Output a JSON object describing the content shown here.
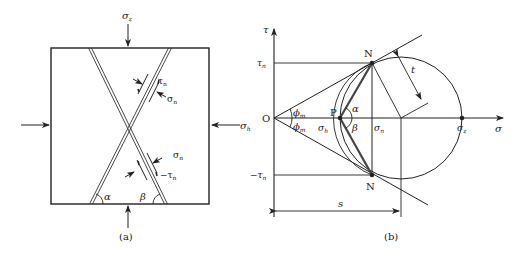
{
  "panel_a": {
    "caption": "(a)",
    "top_load": "σ",
    "top_load_sub": "z",
    "right_load": "σ",
    "right_load_sub": "h",
    "upper_shear": "τ",
    "upper_shear_sub": "n",
    "upper_normal": "σ",
    "upper_normal_sub": "n",
    "lower_normal": "σ",
    "lower_normal_sub": "n",
    "lower_shear": "−τ",
    "lower_shear_sub": "n",
    "angle_left": "α",
    "angle_right": "β"
  },
  "panel_b": {
    "caption": "(b)",
    "y_axis": "τ",
    "x_axis": "σ",
    "origin": "O",
    "tau_n": "τ",
    "tau_n_sub": "n",
    "neg_tau_n": "−τ",
    "neg_tau_n_sub": "n",
    "point_top": "N",
    "point_bottom": "N",
    "point_p": "P",
    "phi_top": "ϕ",
    "phi_top_sub": "m",
    "phi_bottom": "ϕ",
    "phi_bottom_sub": "m",
    "sigma_h": "σ",
    "sigma_h_sub": "h",
    "sigma_n": "σ",
    "sigma_n_sub": "n",
    "sigma_z": "σ",
    "sigma_z_sub": "z",
    "alpha": "α",
    "beta": "β",
    "radius_label": "t",
    "distance_label": "s"
  },
  "colors": {
    "line": "#222222",
    "thick_line": "#444444",
    "background": "#ffffff"
  }
}
